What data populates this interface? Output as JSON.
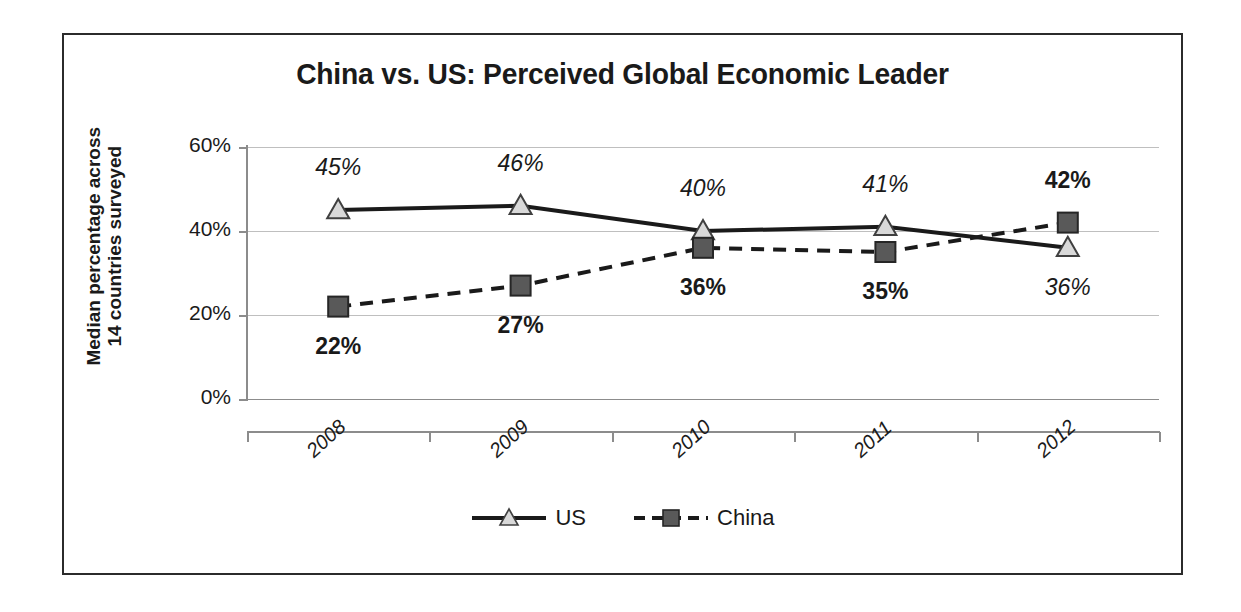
{
  "chart_data": {
    "type": "line",
    "title": "China vs. US: Perceived Global Economic Leader",
    "xlabel": "",
    "ylabel_line1": "Median percentage across",
    "ylabel_line2": "14 countries surveyed",
    "categories": [
      "2008",
      "2009",
      "2010",
      "2011",
      "2012"
    ],
    "series": [
      {
        "name": "US",
        "values": [
          45,
          46,
          40,
          41,
          36
        ],
        "labels": [
          "45%",
          "46%",
          "40%",
          "41%",
          "36%"
        ],
        "marker": "triangle",
        "marker_fill": "#d9d9d9",
        "marker_stroke": "#404040",
        "line_style": "solid",
        "line_color": "#1a1a1a",
        "label_style": "italic"
      },
      {
        "name": "China",
        "values": [
          22,
          27,
          36,
          35,
          42
        ],
        "labels": [
          "22%",
          "27%",
          "36%",
          "35%",
          "42%"
        ],
        "marker": "square",
        "marker_fill": "#595959",
        "marker_stroke": "#262626",
        "line_style": "dashed",
        "line_color": "#1a1a1a",
        "label_style": "bold"
      }
    ],
    "ylim": [
      0,
      60
    ],
    "yticks": [
      0,
      20,
      40,
      60
    ],
    "ytick_labels": [
      "0%",
      "20%",
      "40%",
      "60%"
    ],
    "grid": true,
    "legend_position": "bottom"
  },
  "legend": {
    "items": [
      {
        "label": "US",
        "marker": "triangle-marker",
        "line": "solid-line"
      },
      {
        "label": "China",
        "marker": "square-marker",
        "line": "dashed-line"
      }
    ]
  }
}
